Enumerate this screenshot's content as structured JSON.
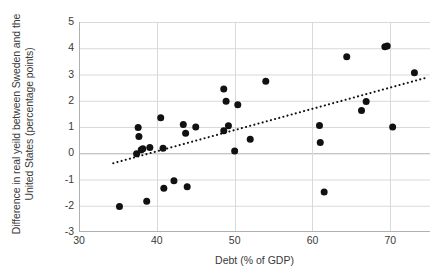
{
  "chart_data": {
    "type": "scatter",
    "title": "",
    "xlabel": "Debt (% of GDP)",
    "ylabel": "Difference in real yeild between Sweden and the United States (percentage points)",
    "ylabel_line1": "Difference in real yeild between Sweden",
    "ylabel_line2": "and the United States (percentage",
    "ylabel_line3": "points)",
    "xlim": [
      30,
      75.1
    ],
    "ylim": [
      -3,
      5
    ],
    "xticks": [
      30,
      40,
      50,
      60,
      70
    ],
    "xtick_labels": [
      "30",
      "40",
      "50",
      "60",
      "70"
    ],
    "yticks": [
      -3,
      -2,
      -1,
      0,
      1,
      2,
      3,
      4,
      5
    ],
    "ytick_labels": [
      "-3",
      "-2",
      "-1",
      "0",
      "1",
      "2",
      "3",
      "4",
      "5"
    ],
    "grid": "horizontal-and-vertical",
    "legend": "none",
    "marker_color": "#111111",
    "marker_size": 7,
    "gridline_color": "#d9d9d9",
    "zero_line_color": "#b0b0b0",
    "trendline": {
      "style": "dotted",
      "color": "#111111",
      "x_start": 34.4,
      "y_start": -0.38,
      "x_end": 74.9,
      "y_end": 2.9
    },
    "points": [
      {
        "x": 35.2,
        "y": -2.03
      },
      {
        "x": 37.4,
        "y": -0.02
      },
      {
        "x": 37.6,
        "y": 0.98
      },
      {
        "x": 37.7,
        "y": 0.64
      },
      {
        "x": 38.0,
        "y": 0.13
      },
      {
        "x": 38.2,
        "y": 0.17
      },
      {
        "x": 38.7,
        "y": -1.83
      },
      {
        "x": 39.1,
        "y": 0.22
      },
      {
        "x": 40.5,
        "y": 1.35
      },
      {
        "x": 40.8,
        "y": 0.19
      },
      {
        "x": 40.9,
        "y": -1.33
      },
      {
        "x": 42.2,
        "y": -1.05
      },
      {
        "x": 43.4,
        "y": 1.1
      },
      {
        "x": 43.7,
        "y": 0.76
      },
      {
        "x": 43.9,
        "y": -1.28
      },
      {
        "x": 45.0,
        "y": 1.0
      },
      {
        "x": 48.6,
        "y": 2.45
      },
      {
        "x": 48.6,
        "y": 0.86
      },
      {
        "x": 48.9,
        "y": 1.98
      },
      {
        "x": 49.2,
        "y": 1.05
      },
      {
        "x": 50.0,
        "y": 0.09
      },
      {
        "x": 50.4,
        "y": 1.85
      },
      {
        "x": 52.0,
        "y": 0.53
      },
      {
        "x": 54.0,
        "y": 2.74
      },
      {
        "x": 60.9,
        "y": 1.06
      },
      {
        "x": 61.0,
        "y": 0.41
      },
      {
        "x": 61.5,
        "y": -1.48
      },
      {
        "x": 64.4,
        "y": 3.68
      },
      {
        "x": 66.3,
        "y": 1.63
      },
      {
        "x": 66.9,
        "y": 1.97
      },
      {
        "x": 69.3,
        "y": 4.06
      },
      {
        "x": 69.6,
        "y": 4.09
      },
      {
        "x": 70.3,
        "y": 1.0
      },
      {
        "x": 73.1,
        "y": 3.07
      }
    ]
  }
}
